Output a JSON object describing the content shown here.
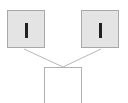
{
  "diagram": {
    "nodes": [
      {
        "id": "left",
        "glyph": "",
        "fill": "#e4e4e4",
        "border": "#a8a8a8",
        "mark_color": "#222222"
      },
      {
        "id": "right",
        "glyph": "",
        "fill": "#e4e4e4",
        "border": "#a8a8a8",
        "mark_color": "#222222"
      },
      {
        "id": "target",
        "fill": "#ffffff",
        "border": "#b0b0b0"
      }
    ],
    "edges": [
      {
        "from": "left",
        "to": "target"
      },
      {
        "from": "right",
        "to": "target"
      }
    ],
    "edge_color": "#b8b8b8"
  }
}
